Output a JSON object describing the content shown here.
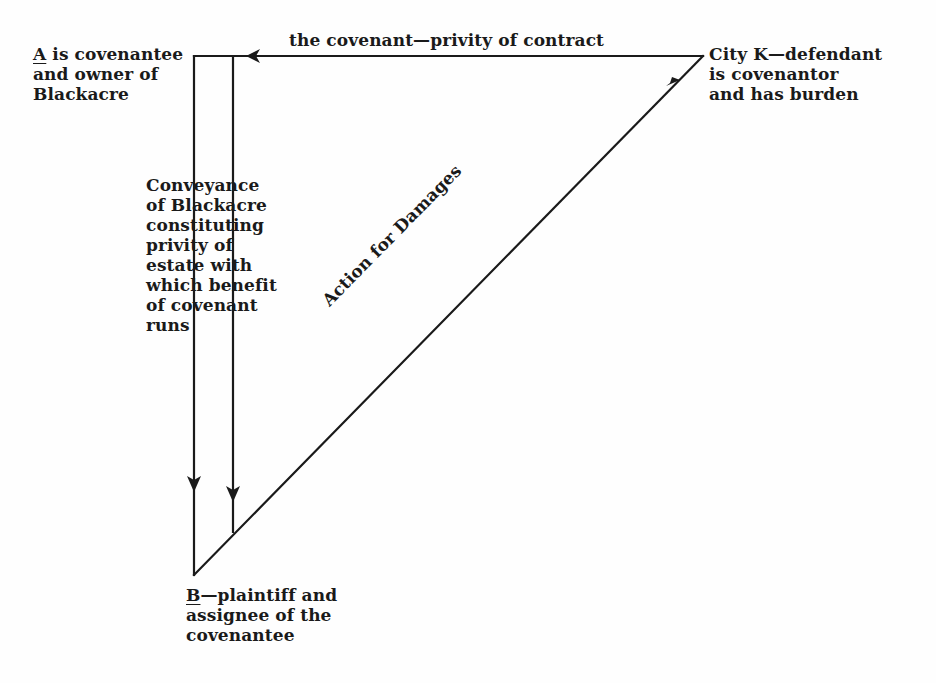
{
  "diagram": {
    "type": "legal-relationship-triangle",
    "parties": {
      "a": {
        "letter": "A",
        "lines": [
          "is covenantee",
          "and owner of",
          "Blackacre"
        ]
      },
      "k": {
        "lines": [
          "City K—defendant",
          "is covenantor",
          "and has burden"
        ]
      },
      "b": {
        "letter": "B",
        "lines": [
          "—plaintiff and",
          "assignee of the",
          "covenantee"
        ]
      }
    },
    "edges": {
      "covenant": {
        "label": "the covenant—privity of contract",
        "from": "City K",
        "to": "A",
        "arrow": "arrow-left"
      },
      "conveyance": {
        "lines": [
          "Conveyance",
          "of Blackacre",
          "constituting",
          "privity of",
          "estate with",
          "which benefit",
          "of covenant",
          "runs"
        ],
        "from": "A",
        "to": "B",
        "arrow": "arrow-down"
      },
      "action": {
        "label": "Action for Damages",
        "from": "B",
        "to": "City K",
        "arrow": "arrow-up-right"
      }
    },
    "colors": {
      "ink": "#1a1a1a",
      "paper": "#fefefe"
    }
  }
}
